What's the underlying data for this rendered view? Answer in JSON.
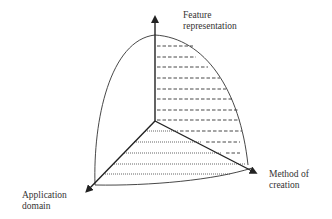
{
  "diagram": {
    "type": "3d-axis-region",
    "axes": [
      {
        "id": "feature",
        "label_line1": "Feature",
        "label_line2": "representation",
        "direction": "up"
      },
      {
        "id": "method",
        "label_line1": "Method of",
        "label_line2": "creation",
        "direction": "down-right"
      },
      {
        "id": "application",
        "label_line1": "Application",
        "label_line2": "domain",
        "direction": "down-left"
      }
    ],
    "hatching": {
      "vertical_plane": "dashed",
      "bottom_plane": "dotted"
    },
    "colors": {
      "stroke": "#222222",
      "text": "#333333",
      "background": "#ffffff"
    }
  }
}
